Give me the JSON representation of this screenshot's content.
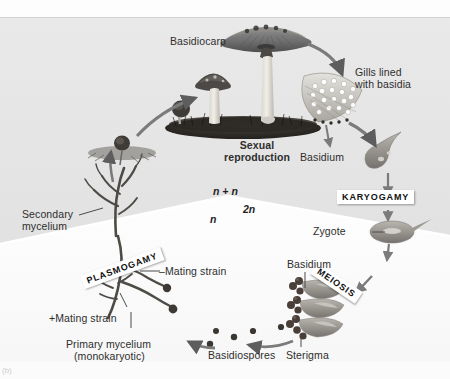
{
  "figure": {
    "corner_label": "(b)",
    "background_color": "#e6e6e6",
    "panel_color": "#f7f7f7"
  },
  "process_labels": [
    {
      "id": "karyogamy",
      "text": "KARYOGAMY"
    },
    {
      "id": "meiosis",
      "text": "MEIOSIS"
    },
    {
      "id": "plasmogamy",
      "text": "PLASMOGAMY"
    }
  ],
  "center_label": {
    "line1": "Sexual",
    "line2": "reproduction"
  },
  "ploidy_labels": [
    {
      "id": "dikaryotic",
      "text": "n + n"
    },
    {
      "id": "haploid",
      "text": "n"
    },
    {
      "id": "diploid",
      "text": "2n"
    }
  ],
  "structure_labels": [
    {
      "id": "basidiocarp",
      "text": "Basidiocarp"
    },
    {
      "id": "gills-line-1",
      "text": "Gills lined"
    },
    {
      "id": "gills-line-2",
      "text": "with basidia"
    },
    {
      "id": "basidium-upper",
      "text": "Basidium"
    },
    {
      "id": "zygote",
      "text": "Zygote"
    },
    {
      "id": "basidium-lower",
      "text": "Basidium"
    },
    {
      "id": "sterigma",
      "text": "Sterigma"
    },
    {
      "id": "basidiospores",
      "text": "Basidiospores"
    },
    {
      "id": "secondary-line-1",
      "text": "Secondary"
    },
    {
      "id": "secondary-line-2",
      "text": "mycelium"
    },
    {
      "id": "minus-mating",
      "text": "–Mating strain"
    },
    {
      "id": "plus-mating",
      "text": "+Mating strain"
    },
    {
      "id": "primary-line-1",
      "text": "Primary mycelium"
    },
    {
      "id": "primary-line-2",
      "text": "(monokaryotic)"
    }
  ],
  "icons": [
    {
      "id": "mushroom-large-icon"
    },
    {
      "id": "mushroom-medium-icon"
    },
    {
      "id": "mushroom-button-icon"
    },
    {
      "id": "soil-bed-icon"
    },
    {
      "id": "gills-wedge-icon"
    },
    {
      "id": "basidium-cell-icon"
    },
    {
      "id": "zygote-cell-icon"
    },
    {
      "id": "basidium-cluster-icon"
    },
    {
      "id": "spore-dot-icon"
    },
    {
      "id": "mycelium-branch-icon"
    },
    {
      "id": "germinating-spore-icon"
    },
    {
      "id": "cycle-arrow-icon"
    }
  ]
}
